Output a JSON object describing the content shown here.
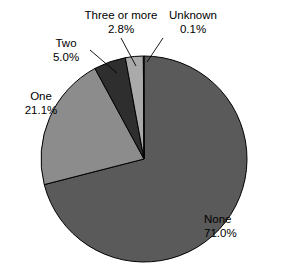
{
  "chart_data": {
    "type": "pie",
    "title": "",
    "subtitle": "",
    "xlabel": "",
    "ylabel": "",
    "legend_position": "none",
    "grid": false,
    "labels_show_percent": true,
    "start_angle_deg": 0,
    "direction": "clockwise",
    "categories": [
      "None",
      "One",
      "Two",
      "Three or more",
      "Unknown"
    ],
    "values": [
      71.0,
      21.1,
      5.0,
      2.8,
      0.1
    ],
    "units": "%",
    "slices": [
      {
        "name": "None",
        "value": 71.0,
        "value_label": "71.0%",
        "color": "#5a5a5a"
      },
      {
        "name": "One",
        "value": 21.1,
        "value_label": "21.1%",
        "color": "#8c8c8c"
      },
      {
        "name": "Two",
        "value": 5.0,
        "value_label": "5.0%",
        "color": "#2e2e2e"
      },
      {
        "name": "Three or more",
        "value": 2.8,
        "value_label": "2.8%",
        "color": "#aaaaaa"
      },
      {
        "name": "Unknown",
        "value": 0.1,
        "value_label": "0.1%",
        "color": "#c8c8c8"
      }
    ]
  },
  "labels": {
    "none": {
      "name": "None",
      "value": "71.0%"
    },
    "one": {
      "name": "One",
      "value": "21.1%"
    },
    "two": {
      "name": "Two",
      "value": "5.0%"
    },
    "three": {
      "name": "Three or more",
      "value": "2.8%"
    },
    "unknown": {
      "name": "Unknown",
      "value": "0.1%"
    }
  },
  "style": {
    "background": "#ffffff",
    "outline": "#000000",
    "text": "#000000"
  }
}
